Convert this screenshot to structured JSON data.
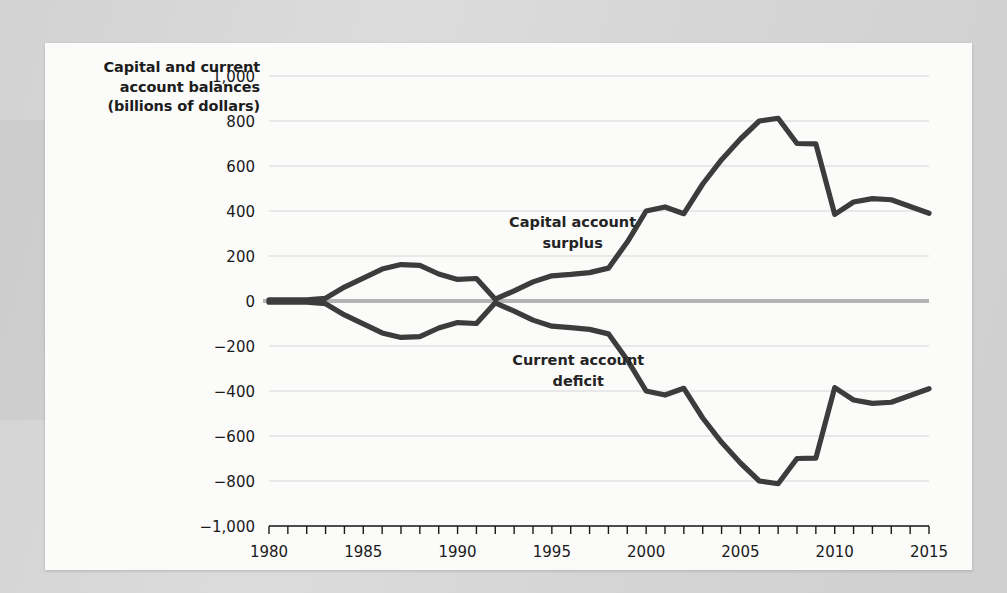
{
  "figure": {
    "axis_title": "Capital and current account balances (billions of dollars)",
    "axis_title_line1": "Capital and current",
    "axis_title_line2": "account balances",
    "axis_title_line3": "(billions of dollars)",
    "line_color": "#3c3c3c",
    "zero_line_color": "#b4b4b4",
    "grid_color": "#e2e2e2",
    "panel_color": "#fbfbfa",
    "page_color": "#d8d8d8"
  },
  "annotations": {
    "capital_line1": "Capital account",
    "capital_line2": "surplus",
    "current_line1": "Current account",
    "current_line2": "deficit"
  },
  "chart_data": {
    "type": "line",
    "title": "",
    "xlabel": "",
    "ylabel": "Capital and current account balances (billions of dollars)",
    "xlim": [
      1980,
      2015
    ],
    "ylim": [
      -1000,
      1000
    ],
    "grid": true,
    "legend": "inline-annotations",
    "ytick_labels": [
      "1,000",
      "800",
      "600",
      "400",
      "200",
      "0",
      "−200",
      "−400",
      "−600",
      "−800",
      "−1,000"
    ],
    "ytick_values": [
      1000,
      800,
      600,
      400,
      200,
      0,
      -200,
      -400,
      -600,
      -800,
      -1000
    ],
    "xtick_labels": [
      "1980",
      "1985",
      "1990",
      "1995",
      "2000",
      "2005",
      "2010",
      "2015"
    ],
    "xtick_values": [
      1980,
      1985,
      1990,
      1995,
      2000,
      2005,
      2010,
      2015
    ],
    "xtick_minor_step": 1,
    "x": [
      1980,
      1981,
      1982,
      1983,
      1984,
      1985,
      1986,
      1987,
      1988,
      1989,
      1990,
      1991,
      1992,
      1993,
      1994,
      1995,
      1996,
      1997,
      1998,
      1999,
      2000,
      2001,
      2002,
      2003,
      2004,
      2005,
      2006,
      2007,
      2008,
      2009,
      2010,
      2011,
      2012,
      2013,
      2014,
      2015
    ],
    "series": [
      {
        "name": "Capital account surplus",
        "label_line1": "Capital account",
        "label_line2": "surplus",
        "color": "#3c3c3c",
        "values": [
          5,
          5,
          5,
          10,
          60,
          100,
          140,
          160,
          160,
          120,
          95,
          100,
          10,
          -45,
          -85,
          -110,
          -120,
          -125,
          -145,
          -260,
          -400,
          -420,
          -390,
          -520,
          -625,
          -720,
          -800,
          -720,
          -700,
          -380,
          -440,
          -450,
          -450,
          -420,
          -390,
          -390
        ]
      },
      {
        "name": "Current account deficit",
        "label_line1": "Current account",
        "label_line2": "deficit",
        "color": "#3c3c3c",
        "values": [
          -5,
          -5,
          -5,
          -10,
          -60,
          -100,
          -140,
          -160,
          -160,
          -120,
          -95,
          -100,
          -10,
          45,
          85,
          110,
          120,
          125,
          145,
          260,
          400,
          420,
          390,
          520,
          625,
          720,
          800,
          720,
          700,
          380,
          440,
          450,
          450,
          420,
          390,
          390
        ]
      }
    ],
    "series_rendered": [
      {
        "name": "Capital account surplus",
        "values": [
          5,
          5,
          5,
          12,
          62,
          102,
          142,
          162,
          158,
          120,
          96,
          100,
          8,
          45,
          85,
          112,
          118,
          126,
          146,
          262,
          400,
          418,
          388,
          520,
          628,
          720,
          800,
          812,
          700,
          698,
          385,
          440,
          455,
          450,
          420,
          390
        ]
      },
      {
        "name": "Current account deficit",
        "values": [
          -5,
          -5,
          -5,
          -12,
          -62,
          -102,
          -142,
          -162,
          -158,
          -120,
          -96,
          -100,
          -8,
          -45,
          -85,
          -112,
          -118,
          -126,
          -146,
          -262,
          -400,
          -418,
          -388,
          -520,
          -628,
          -720,
          -800,
          -812,
          -700,
          -698,
          -385,
          -440,
          -455,
          -450,
          -420,
          -390
        ]
      }
    ]
  }
}
